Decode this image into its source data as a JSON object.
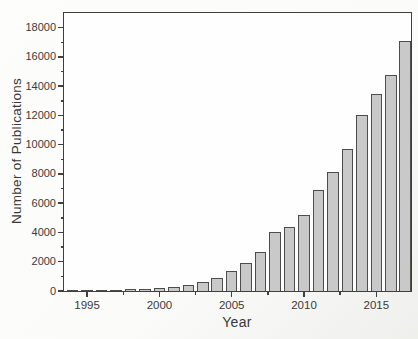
{
  "figure": {
    "background": "#fbfbfa",
    "axis_color": "#3f3f3f",
    "text_color": "#3a3a3a",
    "bar_fill": "#c9c9c9",
    "bar_border": "#4d4d4d"
  },
  "chart_data": {
    "type": "bar",
    "title": "",
    "xlabel": "Year",
    "ylabel": "Number of Publications",
    "categories": [
      1994,
      1995,
      1996,
      1997,
      1998,
      1999,
      2000,
      2001,
      2002,
      2003,
      2004,
      2005,
      2006,
      2007,
      2008,
      2009,
      2010,
      2011,
      2012,
      2013,
      2014,
      2015,
      2016,
      2017
    ],
    "values": [
      60,
      70,
      80,
      90,
      110,
      150,
      210,
      300,
      430,
      600,
      870,
      1350,
      1900,
      2650,
      4000,
      4400,
      5200,
      6900,
      8100,
      9700,
      12000,
      13450,
      14750,
      17100
    ],
    "xlim": [
      1993.4,
      2017.4
    ],
    "ylim": [
      0,
      19000
    ],
    "x_major_ticks": [
      1995,
      2000,
      2005,
      2010,
      2015
    ],
    "x_minor_ticks": [
      1997.5,
      2002.5,
      2007.5,
      2012.5
    ],
    "y_major_ticks": [
      0,
      2000,
      4000,
      6000,
      8000,
      10000,
      12000,
      14000,
      16000,
      18000
    ],
    "y_minor_ticks": [
      1000,
      3000,
      5000,
      7000,
      9000,
      11000,
      13000,
      15000,
      17000
    ],
    "bar_width_years": 0.8,
    "grid": false,
    "legend": "none",
    "frame": "box"
  }
}
